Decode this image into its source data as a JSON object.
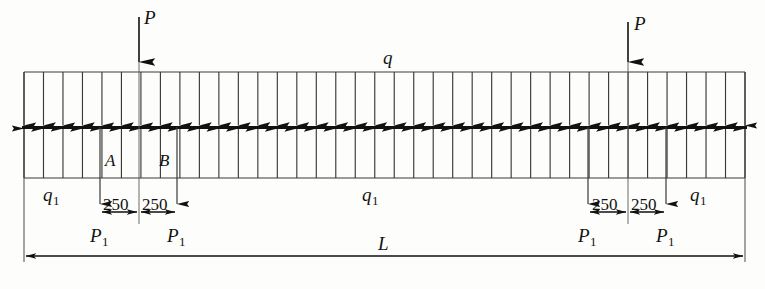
{
  "figure": {
    "type": "structural-beam-load-diagram",
    "title_label": "",
    "beam": {
      "span_label": "L",
      "left_x": 24,
      "right_x": 745,
      "axis_y": 127
    },
    "distributed_loads": {
      "top_label": "q",
      "bottom_label": "q1",
      "bottom_label_text": "q",
      "bottom_label_sub": "1",
      "top_label_text": "q",
      "downward_count": 38,
      "upward_count": 38
    },
    "point_loads": [
      {
        "name": "P",
        "label_text": "P",
        "label_sub": "",
        "x": 139,
        "direction": "down"
      },
      {
        "name": "P",
        "label_text": "P",
        "label_sub": "",
        "x": 628,
        "direction": "down"
      }
    ],
    "reaction_loads": [
      {
        "name": "P1",
        "label_text": "P",
        "label_sub": "1",
        "x": 100,
        "direction": "down"
      },
      {
        "name": "P1",
        "label_text": "P",
        "label_sub": "1",
        "x": 177,
        "direction": "down"
      },
      {
        "name": "P1",
        "label_text": "P",
        "label_sub": "1",
        "x": 588,
        "direction": "down"
      },
      {
        "name": "P1",
        "label_text": "P",
        "label_sub": "1",
        "x": 666,
        "direction": "down"
      }
    ],
    "station_labels": [
      {
        "text": "A",
        "x": 107,
        "y": 157
      },
      {
        "text": "B",
        "x": 160,
        "y": 157
      }
    ],
    "q1_labels": [
      {
        "text": "q",
        "sub": "1",
        "x": 45,
        "y": 188
      },
      {
        "text": "q",
        "sub": "1",
        "x": 363,
        "y": 188
      },
      {
        "text": "q",
        "sub": "1",
        "x": 692,
        "y": 188
      }
    ],
    "dimensions": [
      {
        "value": "250",
        "x": 119,
        "y": 200,
        "group": "left"
      },
      {
        "value": "250",
        "x": 156,
        "y": 200,
        "group": "left"
      },
      {
        "value": "250",
        "x": 607,
        "y": 200,
        "group": "right"
      },
      {
        "value": "250",
        "x": 646,
        "y": 200,
        "group": "right"
      },
      {
        "value": "L",
        "x": 382,
        "y": 240,
        "group": "span"
      }
    ]
  },
  "colors": {
    "ink": "#111111",
    "line": "#2a2a2a",
    "thin": "#555555",
    "paper": "#fdfdfb"
  }
}
